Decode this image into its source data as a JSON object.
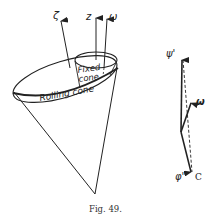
{
  "figure": {
    "caption": "Fig. 49.",
    "left_diagram": {
      "labels": {
        "zeta": "ζ",
        "z": "z",
        "omega": "ω",
        "fixed_cone_line1": "Fixed",
        "fixed_cone_line2": "cone",
        "rolling_cone": "Rolling cone"
      }
    },
    "right_diagram": {
      "labels": {
        "psi_prime": "ψ'",
        "omega": "ω",
        "phi_prime": "φ'",
        "c": "C"
      }
    },
    "colors": {
      "ink": "#222222",
      "background": "#ffffff"
    }
  }
}
